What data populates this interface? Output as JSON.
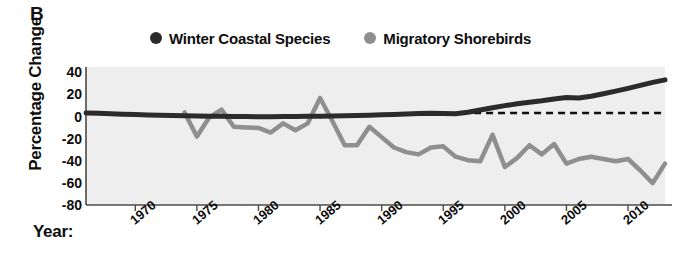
{
  "panel": {
    "label": "B"
  },
  "legend": {
    "position": "top-center",
    "items": [
      {
        "label": "Winter Coastal Species",
        "color": "#2b2b2b",
        "marker": "legend-dot-dark"
      },
      {
        "label": "Migratory Shorebirds",
        "color": "#8f8f8f",
        "marker": "legend-dot-gray"
      }
    ]
  },
  "axes": {
    "ylabel": "Percentage Change",
    "xlabel": "Year:",
    "yticks": [
      "40",
      "20",
      "0",
      "-20",
      "-40",
      "-60",
      "-80"
    ],
    "xticks": [
      "1970",
      "1975",
      "1980",
      "1985",
      "1990",
      "1995",
      "2000",
      "2005",
      "2010"
    ]
  },
  "colors": {
    "plot_background": "#eeeeee",
    "axis": "#4a4a4a",
    "dark_series": "#2b2b2b",
    "gray_series": "#8f8f8f",
    "zero_line": "#111111",
    "text": "#0d0d0d"
  },
  "chart_data": {
    "type": "line",
    "title": "",
    "subtitle": "",
    "xlabel": "Year:",
    "ylabel": "Percentage Change",
    "xlim": [
      1966,
      2013
    ],
    "ylim": [
      -80,
      40
    ],
    "xticks": [
      1970,
      1975,
      1980,
      1985,
      1990,
      1995,
      2000,
      2005,
      2010
    ],
    "yticks": [
      40,
      20,
      0,
      -20,
      -40,
      -60,
      -80
    ],
    "grid": false,
    "legend_position": "top-center",
    "annotations": [
      {
        "text": "B",
        "role": "panel-label",
        "position": "top-left"
      },
      {
        "text": "zero reference dashed line",
        "role": "reference-line",
        "y": 0
      }
    ],
    "series": [
      {
        "name": "Winter Coastal Species",
        "color": "#2b2b2b",
        "x": [
          1966,
          1967,
          1968,
          1969,
          1970,
          1971,
          1972,
          1973,
          1974,
          1975,
          1976,
          1977,
          1978,
          1979,
          1980,
          1981,
          1982,
          1983,
          1984,
          1985,
          1986,
          1987,
          1988,
          1989,
          1990,
          1991,
          1992,
          1993,
          1994,
          1995,
          1996,
          1997,
          1998,
          1999,
          2000,
          2001,
          2002,
          2003,
          2004,
          2005,
          2006,
          2007,
          2008,
          2009,
          2010,
          2011,
          2012,
          2013
        ],
        "values": [
          0,
          -0.3,
          -0.6,
          -1,
          -1.4,
          -1.8,
          -2,
          -2.2,
          -2.4,
          -2.6,
          -2.8,
          -2.9,
          -3,
          -3.1,
          -3.2,
          -3.2,
          -3.1,
          -3,
          -2.9,
          -2.8,
          -2.6,
          -2.4,
          -2.2,
          -2,
          -1.6,
          -1.2,
          -0.8,
          -0.4,
          -0.2,
          -0.4,
          -0.6,
          0.6,
          2.6,
          4.6,
          6.4,
          8,
          9.4,
          10.6,
          12.2,
          13.4,
          13,
          14.6,
          16.8,
          19,
          21.4,
          24,
          26.6,
          28.8
        ]
      },
      {
        "name": "Migratory Shorebirds",
        "color": "#8f8f8f",
        "x": [
          1974,
          1975,
          1976,
          1977,
          1978,
          1979,
          1980,
          1981,
          1982,
          1983,
          1984,
          1985,
          1986,
          1987,
          1988,
          1989,
          1990,
          1991,
          1992,
          1993,
          1994,
          1995,
          1996,
          1997,
          1998,
          1999,
          2000,
          2001,
          2002,
          2003,
          2004,
          2005,
          2006,
          2007,
          2008,
          2009,
          2010,
          2011,
          2012,
          2013
        ],
        "values": [
          0.5,
          -20.5,
          -4,
          3,
          -12,
          -12.5,
          -13,
          -17,
          -9,
          -15,
          -9,
          13,
          -7,
          -28,
          -28,
          -12,
          -21,
          -30,
          -34,
          -36,
          -30,
          -29,
          -38,
          -41,
          -42,
          -19,
          -47,
          -39,
          -28,
          -36,
          -27,
          -44,
          -40,
          -38,
          -40,
          -42,
          -40,
          -50,
          -61,
          -44
        ]
      }
    ]
  }
}
